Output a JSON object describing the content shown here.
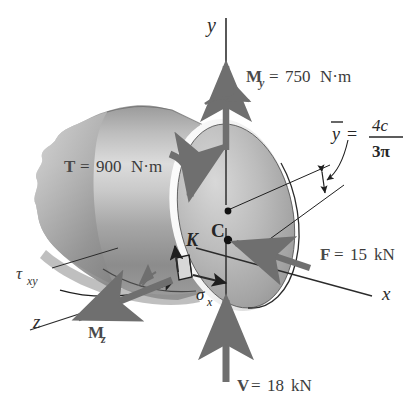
{
  "figure": {
    "axes": {
      "y_label": "y",
      "x_label": "x",
      "z_label": "z"
    },
    "points": {
      "centroid_label": "C",
      "stress_point_label": "K"
    },
    "loads": [
      {
        "name": "moment-y",
        "symbol": "M",
        "subscript": "y",
        "equals": "=",
        "value": "750",
        "unit": "N·m",
        "full_text": "M_y = 750 N·m"
      },
      {
        "name": "torque",
        "symbol": "T",
        "subscript": "",
        "equals": "=",
        "value": "900",
        "unit": "N·m",
        "full_text": "T = 900 N·m"
      },
      {
        "name": "force-axial",
        "symbol": "F",
        "subscript": "",
        "equals": "=",
        "value": "15",
        "unit": "kN",
        "full_text": "F = 15 kN"
      },
      {
        "name": "shear-force",
        "symbol": "V",
        "subscript": "",
        "equals": "=",
        "value": "18",
        "unit": "kN",
        "full_text": "V = 18 kN"
      },
      {
        "name": "moment-z",
        "symbol": "M",
        "subscript": "z",
        "equals": "",
        "value": "",
        "unit": "",
        "full_text": "M_z"
      }
    ],
    "stresses": {
      "shear_symbol": "τ",
      "shear_subscript": "xy",
      "normal_symbol": "σ",
      "normal_subscript": "x"
    },
    "centroid_formula": {
      "variable": "y",
      "has_overbar": true,
      "equals": "=",
      "numerator": "4c",
      "denominator": "3π",
      "full_text": "ȳ = 4c / 3π"
    },
    "colors": {
      "vector_gray": "#6f6f6f",
      "vector_gray_dark": "#5a5a5a",
      "body_light": "#cfcfcf",
      "body_mid": "#a8a8a8",
      "body_dark": "#7d7d7d",
      "face_light": "#c4c4c4",
      "outline": "#1f1f1f",
      "text": "#3b3b3b",
      "background": "#ffffff"
    }
  }
}
